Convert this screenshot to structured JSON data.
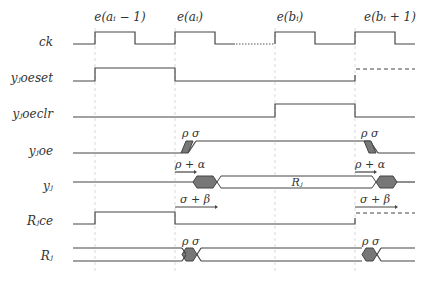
{
  "diagram": {
    "type": "timing-diagram",
    "edges": [
      {
        "label": "e(aᵢ − 1)",
        "x": 95
      },
      {
        "label": "e(aᵢ)",
        "x": 175
      },
      {
        "label": "e(bᵢ)",
        "x": 275
      },
      {
        "label": "e(bᵢ + 1)",
        "x": 355
      }
    ],
    "signals": [
      {
        "name": "ck",
        "label": "ck"
      },
      {
        "name": "yjoeset",
        "label": "yⱼoeset"
      },
      {
        "name": "yjoeclr",
        "label": "yⱼoeclr"
      },
      {
        "name": "yjoe",
        "label": "yⱼoe"
      },
      {
        "name": "yj",
        "label": "yⱼ"
      },
      {
        "name": "Rjce",
        "label": "Rⱼce"
      },
      {
        "name": "Rj",
        "label": "Rⱼ"
      }
    ],
    "annotations": {
      "rho": "ρ",
      "sigma": "σ",
      "rho_plus_alpha": "ρ + α",
      "sigma_plus_beta": "σ + β",
      "bus_value": "Rⱼ"
    }
  }
}
